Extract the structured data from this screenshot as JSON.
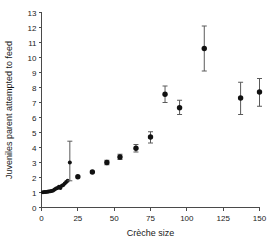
{
  "chart_data": {
    "type": "scatter",
    "title": "",
    "xlabel": "Crèche size",
    "ylabel": "Juveniles parent attempted to feed",
    "xlim": [
      0,
      150
    ],
    "ylim": [
      0,
      13
    ],
    "xticks": [
      0,
      25,
      50,
      75,
      100,
      125,
      150
    ],
    "yticks": [
      0,
      1,
      2,
      3,
      4,
      5,
      6,
      7,
      8,
      9,
      10,
      11,
      12,
      13
    ],
    "xtick_labels": [
      "0",
      "25",
      "50",
      "75",
      "100",
      "125",
      "150"
    ],
    "ytick_labels": [
      "0",
      "1",
      "2",
      "3",
      "4",
      "5",
      "6",
      "7",
      "8",
      "9",
      "10",
      "11",
      "12",
      "13"
    ],
    "grid": false,
    "legend": false,
    "marker_color": "#111111",
    "errorbar_color": "#5a5a5a",
    "axis_color": "#4a4a4a",
    "series": [
      {
        "name": "Juveniles fed vs crèche size",
        "marker": "filled-circle",
        "points": [
          {
            "x": 1,
            "y": 1.02,
            "yerr_low": 1.02,
            "yerr_high": 1.02
          },
          {
            "x": 2,
            "y": 1.03,
            "yerr_low": 1.03,
            "yerr_high": 1.03
          },
          {
            "x": 3,
            "y": 1.04,
            "yerr_low": 1.04,
            "yerr_high": 1.04
          },
          {
            "x": 4,
            "y": 1.05,
            "yerr_low": 1.05,
            "yerr_high": 1.05
          },
          {
            "x": 5,
            "y": 1.06,
            "yerr_low": 1.06,
            "yerr_high": 1.06
          },
          {
            "x": 6,
            "y": 1.08,
            "yerr_low": 1.08,
            "yerr_high": 1.08
          },
          {
            "x": 7,
            "y": 1.1,
            "yerr_low": 1.1,
            "yerr_high": 1.1
          },
          {
            "x": 8,
            "y": 1.14,
            "yerr_low": 1.14,
            "yerr_high": 1.14
          },
          {
            "x": 9,
            "y": 1.2,
            "yerr_low": 1.2,
            "yerr_high": 1.2
          },
          {
            "x": 10,
            "y": 1.26,
            "yerr_low": 1.26,
            "yerr_high": 1.26
          },
          {
            "x": 11,
            "y": 1.3,
            "yerr_low": 1.3,
            "yerr_high": 1.3
          },
          {
            "x": 12,
            "y": 1.38,
            "yerr_low": 1.38,
            "yerr_high": 1.38
          },
          {
            "x": 13,
            "y": 1.3,
            "yerr_low": 1.3,
            "yerr_high": 1.3
          },
          {
            "x": 14,
            "y": 1.45,
            "yerr_low": 1.45,
            "yerr_high": 1.45
          },
          {
            "x": 15,
            "y": 1.5,
            "yerr_low": 1.5,
            "yerr_high": 1.5
          },
          {
            "x": 16,
            "y": 1.6,
            "yerr_low": 1.6,
            "yerr_high": 1.6
          },
          {
            "x": 17,
            "y": 1.7,
            "yerr_low": 1.7,
            "yerr_high": 1.7
          },
          {
            "x": 18,
            "y": 1.78,
            "yerr_low": 1.78,
            "yerr_high": 1.78
          },
          {
            "x": 19.5,
            "y": 3.0,
            "yerr_low": 1.78,
            "yerr_high": 4.42
          },
          {
            "x": 25,
            "y": 2.05,
            "yerr_low": 2.05,
            "yerr_high": 2.05
          },
          {
            "x": 35,
            "y": 2.37,
            "yerr_low": 2.37,
            "yerr_high": 2.37
          },
          {
            "x": 45,
            "y": 3.0,
            "yerr_low": 2.85,
            "yerr_high": 3.15
          },
          {
            "x": 54,
            "y": 3.37,
            "yerr_low": 3.2,
            "yerr_high": 3.55
          },
          {
            "x": 65,
            "y": 3.95,
            "yerr_low": 3.7,
            "yerr_high": 4.2
          },
          {
            "x": 75,
            "y": 4.7,
            "yerr_low": 4.3,
            "yerr_high": 5.05
          },
          {
            "x": 85,
            "y": 7.55,
            "yerr_low": 7.0,
            "yerr_high": 8.1
          },
          {
            "x": 95,
            "y": 6.65,
            "yerr_low": 6.2,
            "yerr_high": 7.15
          },
          {
            "x": 112,
            "y": 10.6,
            "yerr_low": 9.1,
            "yerr_high": 12.1
          },
          {
            "x": 137,
            "y": 7.3,
            "yerr_low": 6.2,
            "yerr_high": 8.35
          },
          {
            "x": 150,
            "y": 7.7,
            "yerr_low": 6.75,
            "yerr_high": 8.6
          }
        ]
      }
    ]
  }
}
